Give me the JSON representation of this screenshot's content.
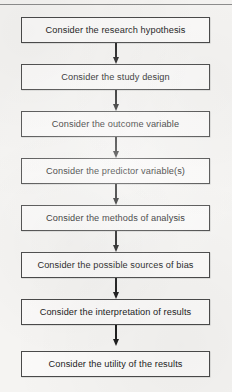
{
  "figure": {
    "type": "flowchart",
    "orientation": "vertical",
    "accent_color": "#1f1f1f",
    "box_border_color": "#4a4a4a",
    "box_fill_color": "#fbfaf9",
    "page_background": "#f5f4f2",
    "header_rule": {
      "name": "top-rule",
      "color": "#8d8d8d"
    },
    "steps": [
      {
        "id": "step-1",
        "label": "Consider the research hypothesis"
      },
      {
        "id": "step-2",
        "label": "Consider the study design"
      },
      {
        "id": "step-3",
        "label": "Consider the outcome variable"
      },
      {
        "id": "step-4",
        "label": "Consider the predictor variable(s)"
      },
      {
        "id": "step-5",
        "label": "Consider the methods of analysis"
      },
      {
        "id": "step-6",
        "label": "Consider the possible sources of bias"
      },
      {
        "id": "step-7",
        "label": "Consider the interpretation of results"
      },
      {
        "id": "step-8",
        "label": "Consider the utility of the results"
      }
    ],
    "connectors": [
      {
        "from": "step-1",
        "to": "step-2",
        "icon": "down-arrow-icon"
      },
      {
        "from": "step-2",
        "to": "step-3",
        "icon": "down-arrow-icon"
      },
      {
        "from": "step-3",
        "to": "step-4",
        "icon": "down-arrow-icon"
      },
      {
        "from": "step-4",
        "to": "step-5",
        "icon": "down-arrow-icon"
      },
      {
        "from": "step-5",
        "to": "step-6",
        "icon": "down-arrow-icon"
      },
      {
        "from": "step-6",
        "to": "step-7",
        "icon": "down-arrow-icon"
      },
      {
        "from": "step-7",
        "to": "step-8",
        "icon": "down-arrow-icon"
      }
    ]
  }
}
